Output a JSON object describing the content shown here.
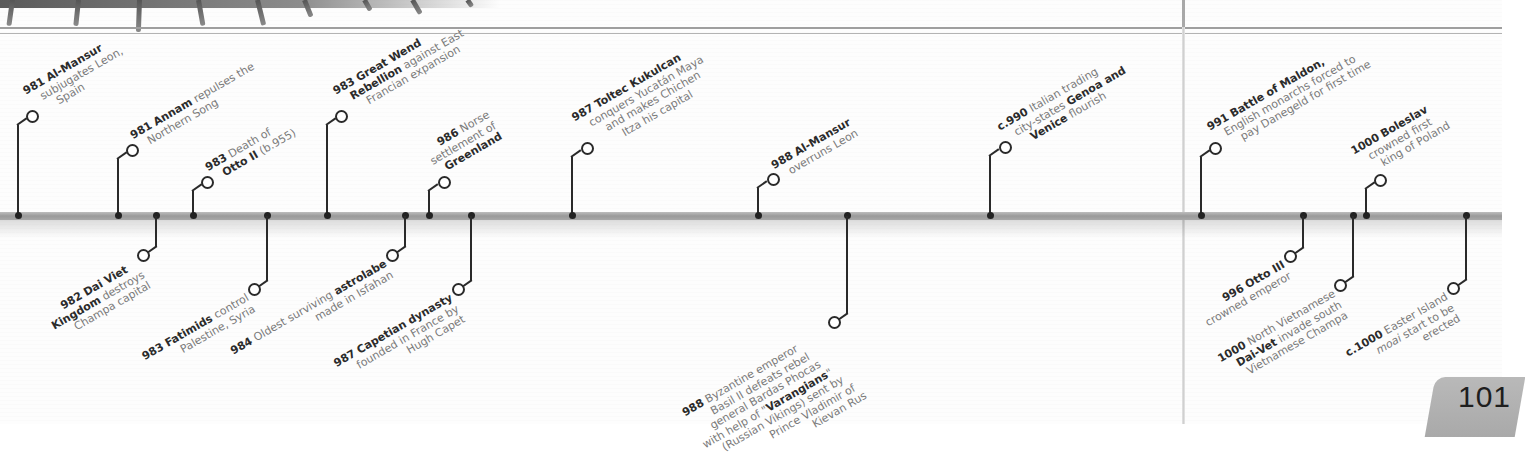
{
  "page": {
    "page_number": "101"
  },
  "timeline": {
    "above": [
      {
        "id": "e981a",
        "x": 18,
        "cx": 31,
        "cy": 115,
        "year": "981",
        "bold": "Al-Mansur",
        "lines": [
          "subjugates Leon,",
          "Spain"
        ]
      },
      {
        "id": "e981b",
        "x": 118,
        "cx": 131,
        "cy": 149,
        "year": "981",
        "bold": "Annam",
        "lines": [
          "repulses the",
          "Northern Song"
        ]
      },
      {
        "id": "e983a",
        "x": 193,
        "cx": 206,
        "cy": 181,
        "year": "983",
        "bold": "",
        "lines": [
          "Death of",
          "Otto II (b.955)"
        ]
      },
      {
        "id": "e983b",
        "x": 327,
        "cx": 340,
        "cy": 115,
        "year": "983",
        "bold": "Great Wend",
        "lines": [
          "Rebellion against East",
          "Francian expansion"
        ]
      },
      {
        "id": "e986",
        "x": 429,
        "cx": 443,
        "cy": 181,
        "year": "986",
        "bold": "",
        "lines": [
          "Norse",
          "settlement of",
          "Greenland"
        ]
      },
      {
        "id": "e987a",
        "x": 572,
        "cx": 586,
        "cy": 147,
        "year": "987",
        "bold": "Toltec Kukulcan",
        "lines": [
          "conquers Yucatán Maya",
          "and makes Chichen",
          "Itza his capital"
        ]
      },
      {
        "id": "e988a",
        "x": 758,
        "cx": 772,
        "cy": 178,
        "year": "988",
        "bold": "Al-Mansur",
        "lines": [
          "overruns Leon"
        ]
      },
      {
        "id": "e990",
        "x": 990,
        "cx": 1004,
        "cy": 146,
        "year": "c.990",
        "bold": "",
        "lines": [
          "Italian trading",
          "city-states Genoa and",
          "Venice flourish"
        ]
      },
      {
        "id": "e991",
        "x": 1201,
        "cx": 1214,
        "cy": 147,
        "year": "991",
        "bold": "Battle of Maldon,",
        "lines": [
          "English monarchs forced to",
          "pay Danegeld for first time"
        ]
      },
      {
        "id": "e1000a",
        "x": 1366,
        "cx": 1379,
        "cy": 179,
        "year": "1000",
        "bold": "Boleslav",
        "lines": [
          "crowned first",
          "king of Poland"
        ]
      }
    ],
    "below": [
      {
        "id": "e982",
        "x": 156,
        "cx": 143,
        "cy": 253,
        "year": "982",
        "bold": "Dai Viet",
        "lines": [
          "Kingdom destroys",
          "Champa capital"
        ]
      },
      {
        "id": "e983c",
        "x": 267,
        "cx": 254,
        "cy": 287,
        "year": "983",
        "bold": "Fatimids",
        "lines": [
          "control",
          "Palestine, Syria"
        ]
      },
      {
        "id": "e984",
        "x": 405,
        "cx": 392,
        "cy": 253,
        "year": "984",
        "bold": "",
        "lines": [
          "Oldest surviving astrolabe",
          "made in Isfahan"
        ]
      },
      {
        "id": "e987b",
        "x": 471,
        "cx": 458,
        "cy": 287,
        "year": "987",
        "bold": "Capetian dynasty",
        "lines": [
          "founded in France by",
          "Hugh Capet"
        ]
      },
      {
        "id": "e988b",
        "x": 847,
        "cx": 834,
        "cy": 320,
        "year": "988",
        "bold": "",
        "lines": [
          "Byzantine emperor",
          "Basil II defeats rebel",
          "general Bardas Phocas",
          "with help of \"Varangians\"",
          "(Russian Vikings) sent by",
          "Prince Vladimir of",
          "Kievan Rus"
        ]
      },
      {
        "id": "e996",
        "x": 1303,
        "cx": 1290,
        "cy": 254,
        "year": "996",
        "bold": "Otto III",
        "lines": [
          "crowned emperor"
        ]
      },
      {
        "id": "e1000b",
        "x": 1353,
        "cx": 1340,
        "cy": 283,
        "year": "1000",
        "bold": "",
        "lines": [
          "North Vietnamese",
          "Dai-Vet invade south",
          "Vietnamese Champa"
        ]
      },
      {
        "id": "e1000c",
        "x": 1466,
        "cx": 1453,
        "cy": 286,
        "year": "c.1000",
        "bold": "",
        "lines": [
          "Easter Island",
          "moai start to be",
          "erected"
        ]
      }
    ]
  },
  "labels": {
    "e981a": {
      "l1_year": "981",
      "l1_bold": "Al-Mansur",
      "l2": "subjugates Leon,",
      "l3": "Spain"
    },
    "e981b": {
      "l1_year": "981",
      "l1_bold": "Annam",
      "l1_rest": " repulses the",
      "l2": "Northern Song"
    },
    "e983a": {
      "l1_year": "983",
      "l1_rest": " Death of",
      "l2_bold": "Otto II",
      "l2_rest": " (b.955)"
    },
    "e983b": {
      "l1_year": "983",
      "l1_bold": "Great Wend",
      "l2_bold": "Rebellion",
      "l2_rest": " against East",
      "l3": "Francian expansion"
    },
    "e986": {
      "l1_year": "986",
      "l1_rest": " Norse",
      "l2": "settlement of",
      "l3_bold": "Greenland"
    },
    "e987a": {
      "l1_year": "987",
      "l1_bold": "Toltec Kukulcan",
      "l2": "conquers Yucatán Maya",
      "l3": "and makes Chichen",
      "l4": "Itza his capital"
    },
    "e988a": {
      "l1_year": "988",
      "l1_bold": "Al-Mansur",
      "l2": "overruns Leon"
    },
    "e990": {
      "l1_year": "c.990",
      "l1_rest": " Italian trading",
      "l2_rest": "city-states ",
      "l2_bold": "Genoa and",
      "l3_bold": "Venice",
      "l3_rest": " flourish"
    },
    "e991": {
      "l1_year": "991",
      "l1_bold": "Battle of Maldon,",
      "l2": "English monarchs forced to",
      "l3": "pay Danegeld for first time"
    },
    "e1000a": {
      "l1_year": "1000",
      "l1_bold": "Boleslav",
      "l2": "crowned first",
      "l3": "king of Poland"
    },
    "e982": {
      "l1_year": "982",
      "l1_bold": "Dai Viet",
      "l2_bold": "Kingdom",
      "l2_rest": " destroys",
      "l3": "Champa capital"
    },
    "e983c": {
      "l1_year": "983",
      "l1_bold": "Fatimids",
      "l1_rest": " control",
      "l2": "Palestine, Syria"
    },
    "e984": {
      "l1_year": "984",
      "l1_rest": " Oldest surviving ",
      "l1_bold": "astrolabe",
      "l2": "made in Isfahan"
    },
    "e987b": {
      "l1_year": "987",
      "l1_bold": "Capetian dynasty",
      "l2": "founded in France by",
      "l3": "Hugh Capet"
    },
    "e988b": {
      "l1_year": "988",
      "l1_rest": " Byzantine emperor",
      "l2": "Basil II defeats rebel",
      "l3": "general Bardas Phocas",
      "l4_rest": "with help of \"",
      "l4_bold": "Varangians",
      "l4_end": "\"",
      "l5": "(Russian Vikings) sent by",
      "l6": "Prince Vladimir of",
      "l7": "Kievan Rus"
    },
    "e996": {
      "l1_year": "996",
      "l1_bold": "Otto III",
      "l2": "crowned emperor"
    },
    "e1000b": {
      "l1_year": "1000",
      "l1_rest": " North Vietnamese",
      "l2_bold": "Dai-Vet",
      "l2_rest": " invade south",
      "l3": "Vietnamese Champa"
    },
    "e1000c": {
      "l1_year": "c.1000",
      "l1_rest": " Easter Island",
      "l2_italic": "moai",
      "l2_rest": " start to be",
      "l3": "erected"
    }
  },
  "colors": {
    "bar": "#a6a6a6",
    "stem": "#2a2a2a",
    "bold_text": "#2b2b2b",
    "body_text": "#7a7a7a",
    "page_tab": "#b3b3b3"
  }
}
